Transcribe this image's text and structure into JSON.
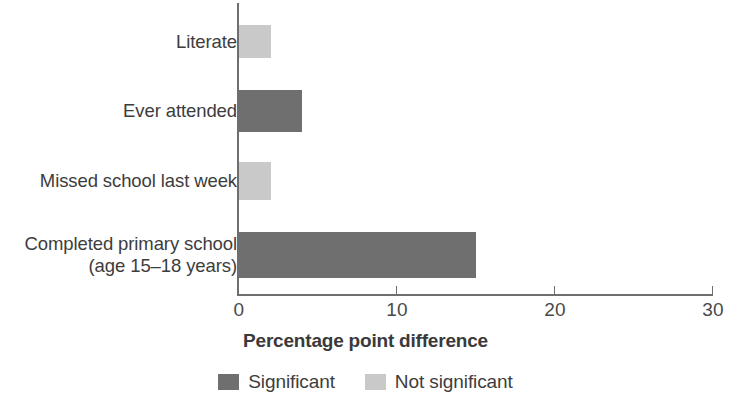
{
  "chart_data": {
    "type": "bar",
    "orientation": "horizontal",
    "title": "",
    "subtitle": "",
    "xlabel": "Percentage point difference",
    "ylabel": "",
    "xlim": [
      0,
      30
    ],
    "xticks": [
      0,
      10,
      20,
      30
    ],
    "xtick_labels": [
      "0",
      "10",
      "20",
      "30"
    ],
    "grid": false,
    "legend_position": "bottom-center",
    "categories": [
      "Literate",
      "Ever attended",
      "Missed school last week",
      "Completed primary school\n(age 15–18 years)"
    ],
    "values": [
      2,
      4,
      2,
      15
    ],
    "point_significance": [
      "Not significant",
      "Significant",
      "Not significant",
      "Significant"
    ],
    "bars": [
      {
        "label": "Literate",
        "value": 2,
        "significance": "Not significant",
        "color": "#c9c9c9"
      },
      {
        "label": "Ever attended",
        "value": 4,
        "significance": "Significant",
        "color": "#6f6f6f"
      },
      {
        "label": "Missed school last week",
        "value": 2,
        "significance": "Not significant",
        "color": "#c9c9c9"
      },
      {
        "label": "Completed primary school\n(age 15–18 years)",
        "value": 15,
        "significance": "Significant",
        "color": "#6f6f6f"
      }
    ],
    "legend": [
      {
        "label": "Significant",
        "color": "#6f6f6f"
      },
      {
        "label": "Not significant",
        "color": "#c9c9c9"
      }
    ],
    "colors": {
      "significant": "#6f6f6f",
      "not_significant": "#c9c9c9",
      "axis": "#6e6e6e",
      "text": "#3d3d3d",
      "background": "#ffffff"
    }
  }
}
